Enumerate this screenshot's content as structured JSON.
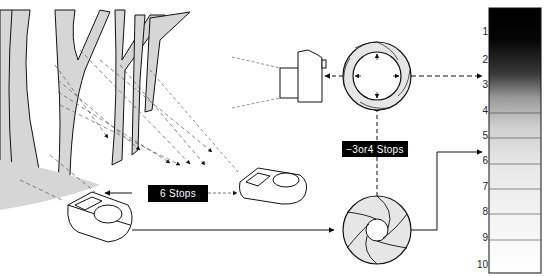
{
  "labels": {
    "six_stops": "6 Stops",
    "three_or_four_stops": "−3or4 Stops"
  },
  "zone_scale": {
    "zones": [
      "1",
      "2",
      "3",
      "4",
      "5",
      "6",
      "7",
      "8",
      "9",
      "10"
    ],
    "arrow_markers_at": [
      "3",
      "6"
    ]
  },
  "colors": {
    "tree_fill": "#d6d6d6",
    "ink": "#111111",
    "label_bg": "#000000",
    "label_text": "#ffffff"
  }
}
